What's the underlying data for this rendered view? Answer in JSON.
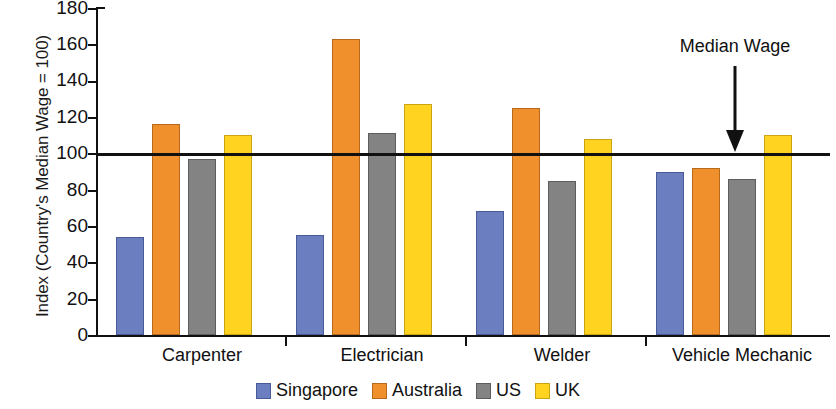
{
  "chart_data": {
    "type": "bar",
    "title": "",
    "xlabel": "",
    "ylabel": "Index (Country's Median Wage = 100)",
    "ylim": [
      0,
      180
    ],
    "yticks": [
      0,
      20,
      40,
      60,
      80,
      100,
      120,
      140,
      160,
      180
    ],
    "grid": false,
    "legend_position": "bottom",
    "categories": [
      "Carpenter",
      "Electrician",
      "Welder",
      "Vehicle Mechanic"
    ],
    "series": [
      {
        "name": "Singapore",
        "color": "#6b7ec0",
        "values": [
          54,
          55,
          68,
          90
        ]
      },
      {
        "name": "Australia",
        "color": "#f0902d",
        "values": [
          116,
          163,
          125,
          92
        ]
      },
      {
        "name": "US",
        "color": "#838383",
        "values": [
          97,
          111,
          85,
          86
        ]
      },
      {
        "name": "UK",
        "color": "#ffd320",
        "values": [
          110,
          127,
          108,
          110
        ]
      }
    ],
    "annotations": [
      {
        "text": "Median Wage",
        "type": "arrow-down",
        "target_value": 100
      }
    ],
    "reference_line": {
      "value": 100,
      "label": "Median Wage",
      "color": "#111111"
    }
  },
  "legend": {
    "items": [
      {
        "label": "Singapore",
        "swatch": "legend-swatch-singapore"
      },
      {
        "label": "Australia",
        "swatch": "legend-swatch-australia"
      },
      {
        "label": "US",
        "swatch": "legend-swatch-us"
      },
      {
        "label": "UK",
        "swatch": "legend-swatch-uk"
      }
    ]
  },
  "axis": {
    "y_title": "Index (Country's Median Wage = 100)",
    "y_tick_labels": [
      "180",
      "160",
      "140",
      "120",
      "100",
      "80",
      "60",
      "40",
      "20",
      "0"
    ],
    "x_tick_labels": [
      "Carpenter",
      "Electrician",
      "Welder",
      "Vehicle Mechanic"
    ]
  },
  "annotation": {
    "label": "Median Wage"
  }
}
